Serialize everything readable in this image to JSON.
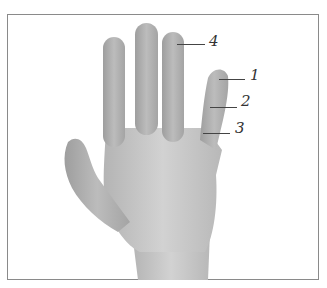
{
  "figure": {
    "labels": [
      {
        "id": "1",
        "text": "1"
      },
      {
        "id": "2",
        "text": "2"
      },
      {
        "id": "3",
        "text": "3"
      },
      {
        "id": "4",
        "text": "4"
      }
    ],
    "colors": {
      "skin": "#c9c9c9",
      "skin_shadow": "#a9a9a9",
      "frame": "#8a8a8a",
      "ink": "#333333"
    }
  }
}
